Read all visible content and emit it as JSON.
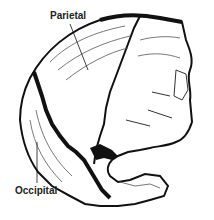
{
  "figure": {
    "labels": {
      "parietal": "Parietal",
      "occipital": "Occipital"
    },
    "colors": {
      "ink": "#111111",
      "background": "#ffffff"
    }
  }
}
